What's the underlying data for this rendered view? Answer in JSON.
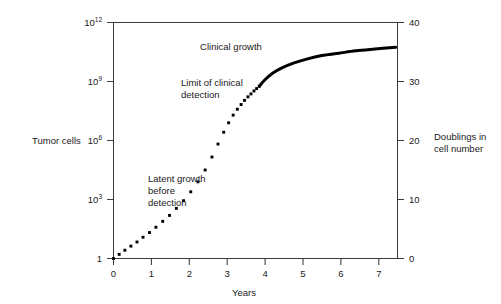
{
  "chart_data": {
    "type": "line",
    "title": "",
    "subtitle": "",
    "xlabel": "Years",
    "ylabel": "Tumor cells",
    "y2label_line1": "Doublings in",
    "y2label_line2": "cell number",
    "xlim": [
      0,
      7.5
    ],
    "ylim_log10": [
      0,
      12
    ],
    "y2lim": [
      0,
      40
    ],
    "grid": false,
    "legend": "none",
    "x_ticks": [
      0,
      1,
      2,
      3,
      4,
      5,
      6,
      7
    ],
    "x_tick_labels": [
      "0",
      "1",
      "2",
      "3",
      "4",
      "5",
      "6",
      "7"
    ],
    "y_ticks_log10": [
      0,
      3,
      6,
      9,
      12
    ],
    "y_tick_labels": [
      {
        "base": "1",
        "exp": ""
      },
      {
        "base": "10",
        "exp": "3"
      },
      {
        "base": "10",
        "exp": "6"
      },
      {
        "base": "10",
        "exp": "9"
      },
      {
        "base": "10",
        "exp": "12"
      }
    ],
    "y2_ticks": [
      0,
      10,
      20,
      30,
      40
    ],
    "y2_tick_labels": [
      "0",
      "10",
      "20",
      "30",
      "40"
    ],
    "series": [
      {
        "name": "Latent growth before detection",
        "style": "dotted",
        "color": "#000000",
        "x": [
          0.0,
          0.15,
          0.3,
          0.46,
          0.62,
          0.78,
          0.95,
          1.12,
          1.3,
          1.48,
          1.66,
          1.85,
          2.04,
          2.23,
          2.42,
          2.6,
          2.76,
          2.91,
          3.04,
          3.16,
          3.27,
          3.37,
          3.46,
          3.55,
          3.63,
          3.71,
          3.78,
          3.85
        ],
        "y_doublings": [
          0.0,
          0.7,
          1.4,
          2.1,
          2.8,
          3.6,
          4.4,
          5.3,
          6.3,
          7.3,
          8.5,
          9.8,
          11.3,
          13.0,
          15.0,
          17.2,
          19.4,
          21.4,
          23.0,
          24.3,
          25.3,
          26.1,
          26.8,
          27.4,
          27.9,
          28.4,
          28.8,
          29.2
        ]
      },
      {
        "name": "Clinical growth",
        "style": "solid",
        "color": "#000000",
        "x": [
          3.85,
          4.0,
          4.2,
          4.45,
          4.75,
          5.1,
          5.5,
          5.95,
          6.4,
          6.9,
          7.45
        ],
        "y_doublings": [
          29.2,
          30.3,
          31.4,
          32.3,
          33.1,
          33.8,
          34.4,
          34.8,
          35.2,
          35.5,
          35.8
        ]
      }
    ],
    "annotations": [
      {
        "name": "clinical-growth",
        "text": "Clinical growth",
        "x": 2.9,
        "y_doublings": 37.0
      },
      {
        "name": "limit-of-clinical-detection",
        "line1": "Limit of clinical",
        "line2": "detection",
        "x": 1.55,
        "y_doublings": 30.3
      },
      {
        "name": "latent-growth-before-detection",
        "line1": "Latent growth",
        "line2": "before",
        "line3": "detection",
        "x": 0.85,
        "y_doublings": 13.2
      }
    ]
  },
  "axes": {
    "left_title": "Tumor cells",
    "bottom_title": "Years",
    "right_title_line1": "Doublings in",
    "right_title_line2": "cell number"
  },
  "annotations": {
    "clinical_growth": "Clinical growth",
    "limit_line1": "Limit of clinical",
    "limit_line2": "detection",
    "latent_line1": "Latent growth",
    "latent_line2": "before",
    "latent_line3": "detection"
  },
  "colors": {
    "curve": "#000000",
    "axis": "#3b3b3b",
    "text": "#1a1a1a",
    "background": "#ffffff"
  }
}
